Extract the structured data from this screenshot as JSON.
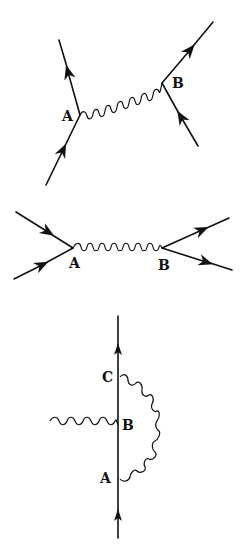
{
  "diagrams": [
    {
      "name": "t-channel-exchange",
      "vertices": [
        {
          "label": "A",
          "x": 80,
          "y": 115
        },
        {
          "label": "B",
          "x": 162,
          "y": 83
        }
      ],
      "fermion_lines": [
        {
          "from": [
            46,
            185
          ],
          "to": [
            80,
            115
          ],
          "arrow": "toward-vertex"
        },
        {
          "from": [
            80,
            115
          ],
          "to": [
            59,
            40
          ],
          "arrow": "away-from-vertex"
        },
        {
          "from": [
            198,
            146
          ],
          "to": [
            162,
            83
          ],
          "arrow": "toward-vertex"
        },
        {
          "from": [
            162,
            83
          ],
          "to": [
            213,
            22
          ],
          "arrow": "away-from-vertex"
        }
      ],
      "photon": {
        "from": "A",
        "to": "B"
      }
    },
    {
      "name": "s-channel-annihilation",
      "vertices": [
        {
          "label": "A",
          "x": 73,
          "y": 248
        },
        {
          "label": "B",
          "x": 162,
          "y": 248
        }
      ],
      "fermion_lines": [
        {
          "from": [
            16,
            212
          ],
          "to": [
            73,
            248
          ],
          "arrow": "toward-vertex"
        },
        {
          "from": [
            14,
            279
          ],
          "to": [
            73,
            248
          ],
          "arrow": "toward-vertex"
        },
        {
          "from": [
            162,
            248
          ],
          "to": [
            229,
            218
          ],
          "arrow": "away-from-vertex"
        },
        {
          "from": [
            162,
            248
          ],
          "to": [
            232,
            270
          ],
          "arrow": "away-from-vertex"
        }
      ],
      "photon": {
        "from": "A",
        "to": "B"
      }
    },
    {
      "name": "vertex-correction",
      "vertices": [
        {
          "label": "C",
          "x": 118,
          "y": 376
        },
        {
          "label": "B",
          "x": 118,
          "y": 425
        },
        {
          "label": "A",
          "x": 118,
          "y": 478
        }
      ],
      "fermion_lines": [
        {
          "from": [
            118,
            538
          ],
          "to": [
            118,
            316
          ],
          "arrow": "upward"
        }
      ],
      "photons": [
        {
          "from": "external-left",
          "to": "B"
        },
        {
          "from": "A",
          "to": "C",
          "shape": "semicircle-right"
        }
      ]
    }
  ],
  "labels": {
    "d1_A": "A",
    "d1_B": "B",
    "d2_A": "A",
    "d2_B": "B",
    "d3_C": "C",
    "d3_B": "B",
    "d3_A": "A"
  }
}
